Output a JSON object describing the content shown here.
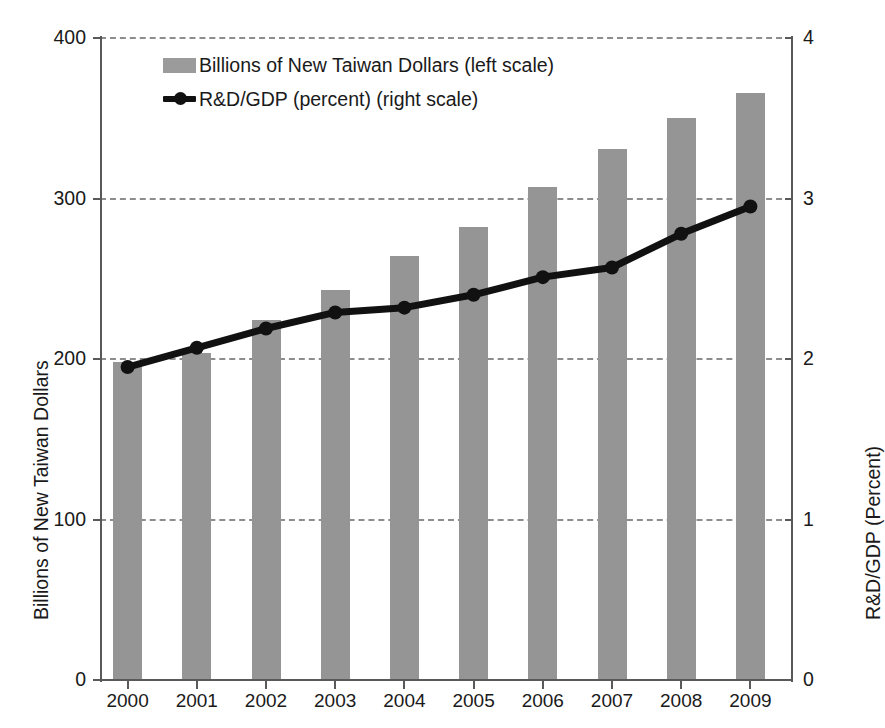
{
  "chart_data": {
    "type": "bar",
    "title": "",
    "subtitle": "",
    "categories": [
      "2000",
      "2001",
      "2002",
      "2003",
      "2004",
      "2005",
      "2006",
      "2007",
      "2008",
      "2009"
    ],
    "xlabel": "",
    "grid": true,
    "legend_position": "top-left-inside",
    "series": [
      {
        "name": "Billions of New Taiwan Dollars (left scale)",
        "type": "bar",
        "axis": "left",
        "color": "#959595",
        "values": [
          198,
          204,
          224,
          243,
          264,
          282,
          307,
          331,
          350,
          366
        ]
      },
      {
        "name": "R&D/GDP (percent) (right scale)",
        "type": "line",
        "axis": "right",
        "color": "#111111",
        "values": [
          1.95,
          2.07,
          2.19,
          2.29,
          2.32,
          2.4,
          2.51,
          2.57,
          2.78,
          2.95
        ]
      }
    ],
    "axes": {
      "left": {
        "label": "Billions of New Taiwan Dollars",
        "ticks": [
          "0",
          "100",
          "200",
          "300",
          "400"
        ],
        "tick_values": [
          0,
          100,
          200,
          300,
          400
        ],
        "ylim": [
          0,
          400
        ]
      },
      "right": {
        "label": "R&D/GDP (Percent)",
        "ticks": [
          "0",
          "1",
          "2",
          "3",
          "4"
        ],
        "tick_values": [
          0,
          1,
          2,
          3,
          4
        ],
        "ylim": [
          0,
          4
        ]
      }
    }
  },
  "legend": {
    "entries": [
      {
        "label": "Billions of New Taiwan Dollars (left scale)",
        "marker": "bar-swatch"
      },
      {
        "label": "R&D/GDP (percent) (right scale)",
        "marker": "line-marker-swatch"
      }
    ]
  },
  "colors": {
    "bar": "#959595",
    "line": "#111111",
    "grid": "#8d8d8d",
    "axis": "#595959",
    "background": "#ffffff"
  }
}
